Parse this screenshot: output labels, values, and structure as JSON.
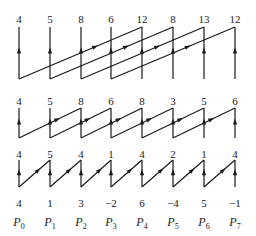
{
  "columns_x": [
    19,
    50,
    81,
    111,
    142,
    173,
    204,
    235
  ],
  "rows": [
    {
      "name": "stage-1-output",
      "values": [
        "4",
        "5",
        "8",
        "6",
        "12",
        "8",
        "13",
        "12"
      ],
      "y": 13
    },
    {
      "name": "stage-2-output",
      "values": [
        "4",
        "5",
        "8",
        "6",
        "8",
        "3",
        "5",
        "6"
      ],
      "y": 95
    },
    {
      "name": "stage-3-output",
      "values": [
        "4",
        "5",
        "4",
        "1",
        "4",
        "2",
        "1",
        "4"
      ],
      "y": 148
    },
    {
      "name": "input-values",
      "values": [
        "4",
        "1",
        "3",
        "-2",
        "6",
        "-4",
        "5",
        "-1"
      ],
      "y": 197
    }
  ],
  "processors": {
    "prefix": "P",
    "labels": [
      "0",
      "1",
      "2",
      "3",
      "4",
      "5",
      "6",
      "7"
    ],
    "y": 215
  },
  "stages": [
    {
      "name": "stage-1",
      "top": 27,
      "bottom": 79,
      "offset": 4
    },
    {
      "name": "stage-2",
      "top": 108,
      "bottom": 138,
      "offset": 2
    },
    {
      "name": "stage-3",
      "top": 160,
      "bottom": 187,
      "offset": 1
    }
  ],
  "line_color": "#1a1a1a"
}
